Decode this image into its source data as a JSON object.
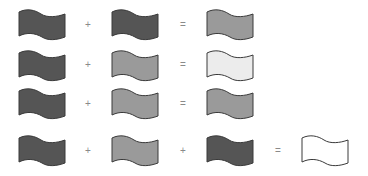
{
  "colors": {
    "dark": "#555555",
    "medium": "#9a9a9a",
    "light": "#ececec",
    "white": "#ffffff",
    "outline": "#3a3a3a"
  },
  "operators": {
    "plus": "+",
    "equals": "="
  },
  "equations": [
    {
      "inputs": [
        "dark",
        "dark"
      ],
      "result": "medium"
    },
    {
      "inputs": [
        "dark",
        "medium"
      ],
      "result": "light"
    },
    {
      "inputs": [
        "dark",
        "medium"
      ],
      "result": "medium"
    },
    {
      "inputs": [
        "dark",
        "medium",
        "dark"
      ],
      "result": "white"
    }
  ]
}
